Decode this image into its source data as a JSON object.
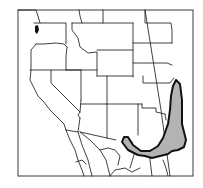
{
  "map": {
    "type": "species-range-map",
    "region": "Western North America",
    "colors": {
      "background": "#ffffff",
      "boundary_stroke": "#2a2a2a",
      "range_fill": "#b3b3b3",
      "range_stroke": "#111111",
      "frame_stroke": "#3a3a3a"
    },
    "features": {
      "state_boundaries": "shown",
      "range_area": "shaded",
      "labels": []
    }
  }
}
